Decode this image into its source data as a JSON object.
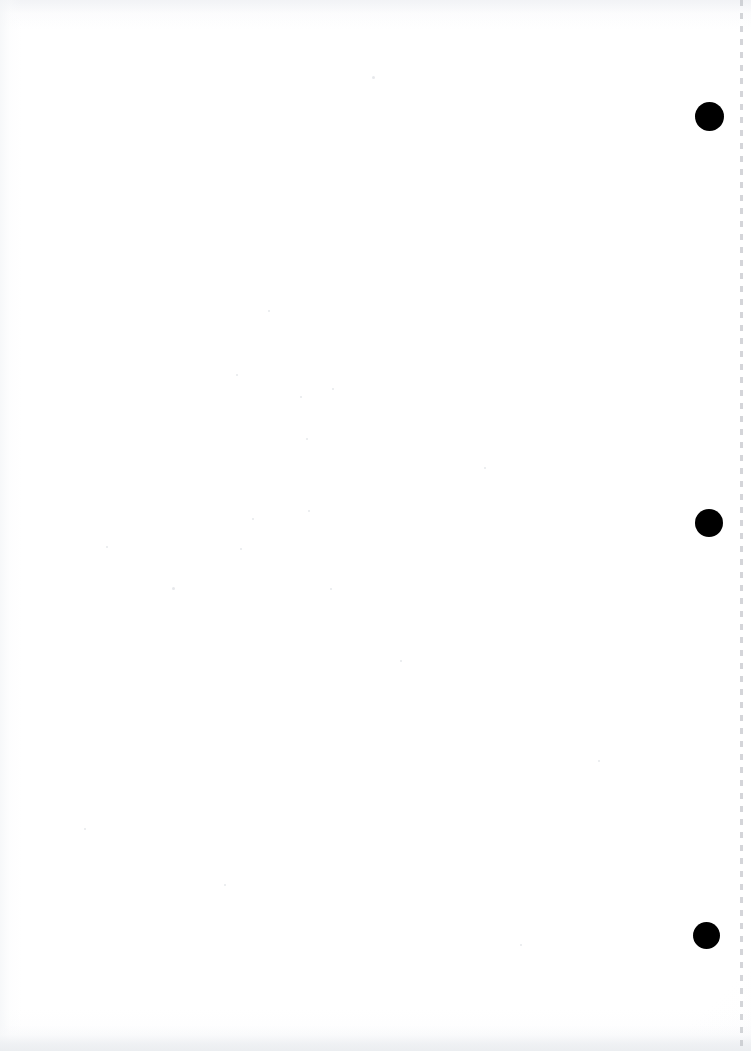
{
  "document": {
    "kind": "scanned-page",
    "title": "Scanned Page",
    "page_width": 751,
    "page_height": 1051,
    "paper_color": "#ffffff",
    "ink_color": "#000000",
    "content_text": "",
    "note": "blank scanned sheet"
  },
  "marks": {
    "label": "black dot marks",
    "color": "#000000",
    "count": 3,
    "items": [
      {
        "name": "dot-mark-top",
        "label": "Dot 1",
        "center_x": 710,
        "center_y": 117,
        "diameter": 29,
        "left": 695,
        "top": 102
      },
      {
        "name": "dot-mark-middle",
        "label": "Dot 2",
        "center_x": 709,
        "center_y": 523,
        "diameter": 28,
        "left": 695,
        "top": 509
      },
      {
        "name": "dot-mark-bottom",
        "label": "Dot 3",
        "center_x": 707,
        "center_y": 936,
        "diameter": 27,
        "left": 693,
        "top": 922
      }
    ]
  },
  "page_edge": {
    "name": "dashed page edge rule",
    "color": "#b9bcc1",
    "x": 740,
    "width": 3,
    "dash_length": 6,
    "gap_length": 7
  },
  "artifacts": {
    "bottom_band_color": "#eaedf0",
    "top_smudge_color": "#eef0f3",
    "specks": [
      {
        "x": 372,
        "y": 76,
        "size": 3
      },
      {
        "x": 172,
        "y": 587,
        "size": 3
      },
      {
        "x": 268,
        "y": 310,
        "size": 2
      },
      {
        "x": 236,
        "y": 374,
        "size": 2
      },
      {
        "x": 332,
        "y": 388,
        "size": 2
      },
      {
        "x": 300,
        "y": 396,
        "size": 2
      },
      {
        "x": 306,
        "y": 438,
        "size": 2
      },
      {
        "x": 484,
        "y": 467,
        "size": 2
      },
      {
        "x": 308,
        "y": 510,
        "size": 2
      },
      {
        "x": 252,
        "y": 518,
        "size": 2
      },
      {
        "x": 106,
        "y": 546,
        "size": 2
      },
      {
        "x": 240,
        "y": 548,
        "size": 2
      },
      {
        "x": 330,
        "y": 588,
        "size": 2
      },
      {
        "x": 400,
        "y": 660,
        "size": 2
      },
      {
        "x": 84,
        "y": 828,
        "size": 2
      },
      {
        "x": 224,
        "y": 884,
        "size": 2
      },
      {
        "x": 598,
        "y": 760,
        "size": 2
      },
      {
        "x": 520,
        "y": 944,
        "size": 2
      }
    ]
  }
}
